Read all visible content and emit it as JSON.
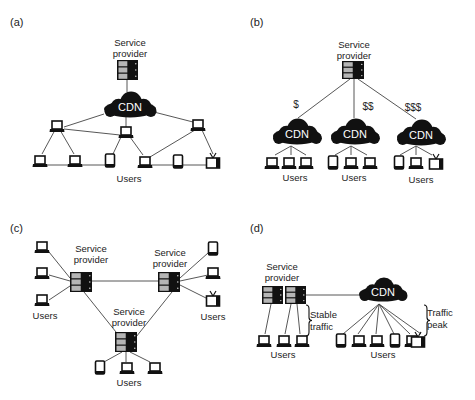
{
  "panels": [
    {
      "id": "a",
      "label": "(a)",
      "label_pos": [
        10,
        26
      ],
      "texts": [
        {
          "text": "Service",
          "x": 130,
          "y": 46,
          "size": 9.5
        },
        {
          "text": "provider",
          "x": 130,
          "y": 57,
          "size": 9.5
        },
        {
          "text": "Users",
          "x": 129,
          "y": 182,
          "size": 9.5
        }
      ],
      "servers": [
        {
          "x": 117,
          "y": 60,
          "w": 21,
          "h": 20
        }
      ],
      "clouds": [
        {
          "cx": 130,
          "cy": 106,
          "w": 52,
          "h": 26,
          "text": "CDN"
        }
      ],
      "devices": [
        {
          "type": "laptop",
          "x": 57,
          "y": 125
        },
        {
          "type": "laptop",
          "x": 126,
          "y": 131
        },
        {
          "type": "laptop",
          "x": 198,
          "y": 124
        },
        {
          "type": "laptop",
          "x": 40,
          "y": 160
        },
        {
          "type": "laptop",
          "x": 75,
          "y": 160
        },
        {
          "type": "tablet",
          "x": 110,
          "y": 160
        },
        {
          "type": "laptop",
          "x": 145,
          "y": 161
        },
        {
          "type": "tablet",
          "x": 178,
          "y": 161
        },
        {
          "type": "tv",
          "x": 213,
          "y": 161
        }
      ],
      "lines": [
        [
          127,
          80,
          127,
          92
        ],
        [
          104,
          114,
          64,
          127
        ],
        [
          126,
          117,
          126,
          127
        ],
        [
          150,
          111,
          193,
          122
        ],
        [
          64,
          129,
          120,
          135
        ],
        [
          55,
          130,
          42,
          154
        ],
        [
          60,
          130,
          74,
          154
        ],
        [
          121,
          137,
          113,
          154
        ],
        [
          130,
          137,
          143,
          155
        ],
        [
          195,
          130,
          150,
          157
        ],
        [
          202,
          130,
          213,
          154
        ],
        [
          44,
          165,
          72,
          165
        ],
        [
          80,
          165,
          108,
          165
        ],
        [
          150,
          165,
          174,
          165
        ],
        [
          182,
          165,
          208,
          165
        ]
      ]
    },
    {
      "id": "b",
      "label": "(b)",
      "label_pos": [
        250,
        26
      ],
      "texts": [
        {
          "text": "Service",
          "x": 354,
          "y": 48,
          "size": 9.5
        },
        {
          "text": "provider",
          "x": 354,
          "y": 59,
          "size": 9.5
        },
        {
          "text": "$",
          "x": 296,
          "y": 108,
          "size": 10
        },
        {
          "text": "$$",
          "x": 368,
          "y": 110,
          "size": 10
        },
        {
          "text": "$$$",
          "x": 413,
          "y": 111,
          "size": 10
        },
        {
          "text": "Users",
          "x": 295,
          "y": 181,
          "size": 9.5
        },
        {
          "text": "Users",
          "x": 354,
          "y": 181,
          "size": 9.5
        },
        {
          "text": "Users",
          "x": 421,
          "y": 183,
          "size": 9.5
        }
      ],
      "servers": [
        {
          "x": 342,
          "y": 61,
          "w": 22,
          "h": 18
        }
      ],
      "clouds": [
        {
          "cx": 297,
          "cy": 133,
          "w": 48,
          "h": 26,
          "text": "CDN"
        },
        {
          "cx": 355,
          "cy": 133,
          "w": 48,
          "h": 26,
          "text": "CDN"
        },
        {
          "cx": 421,
          "cy": 134,
          "w": 48,
          "h": 26,
          "text": "CDN"
        }
      ],
      "devices": [
        {
          "type": "laptop",
          "x": 272,
          "y": 162
        },
        {
          "type": "laptop",
          "x": 289,
          "y": 162
        },
        {
          "type": "laptop",
          "x": 306,
          "y": 162
        },
        {
          "type": "tablet",
          "x": 333,
          "y": 162
        },
        {
          "type": "laptop",
          "x": 351,
          "y": 162
        },
        {
          "type": "laptop",
          "x": 370,
          "y": 162
        },
        {
          "type": "tablet",
          "x": 399,
          "y": 162
        },
        {
          "type": "laptop",
          "x": 416,
          "y": 162
        },
        {
          "type": "tv",
          "x": 436,
          "y": 162
        }
      ],
      "lines": [
        [
          350,
          79,
          298,
          118
        ],
        [
          354,
          79,
          354,
          118
        ],
        [
          358,
          79,
          416,
          119
        ],
        [
          291,
          146,
          275,
          155
        ],
        [
          291,
          146,
          291,
          155
        ],
        [
          291,
          146,
          306,
          155
        ],
        [
          351,
          146,
          335,
          155
        ],
        [
          351,
          146,
          351,
          155
        ],
        [
          351,
          146,
          367,
          155
        ],
        [
          416,
          146,
          400,
          155
        ],
        [
          416,
          146,
          416,
          155
        ],
        [
          416,
          146,
          432,
          155
        ]
      ]
    },
    {
      "id": "c",
      "label": "(c)",
      "label_pos": [
        10,
        232
      ],
      "texts": [
        {
          "text": "Service",
          "x": 91,
          "y": 252,
          "size": 9.5
        },
        {
          "text": "provider",
          "x": 91,
          "y": 263,
          "size": 9.5
        },
        {
          "text": "Service",
          "x": 170,
          "y": 256,
          "size": 9.5
        },
        {
          "text": "provider",
          "x": 170,
          "y": 267,
          "size": 9.5
        },
        {
          "text": "Service",
          "x": 129,
          "y": 315,
          "size": 9.5
        },
        {
          "text": "provider",
          "x": 129,
          "y": 326,
          "size": 9.5
        },
        {
          "text": "Users",
          "x": 45,
          "y": 319,
          "size": 9.5
        },
        {
          "text": "Users",
          "x": 213,
          "y": 320,
          "size": 9.5
        },
        {
          "text": "Users",
          "x": 129,
          "y": 386,
          "size": 9.5
        }
      ],
      "servers": [
        {
          "x": 70,
          "y": 272,
          "w": 22,
          "h": 20
        },
        {
          "x": 158,
          "y": 272,
          "w": 22,
          "h": 20
        },
        {
          "x": 115,
          "y": 332,
          "w": 22,
          "h": 20
        }
      ],
      "clouds": [],
      "devices": [
        {
          "type": "laptop",
          "x": 42,
          "y": 246
        },
        {
          "type": "laptop",
          "x": 42,
          "y": 272
        },
        {
          "type": "laptop",
          "x": 42,
          "y": 299
        },
        {
          "type": "tablet",
          "x": 213,
          "y": 248
        },
        {
          "type": "laptop",
          "x": 213,
          "y": 272
        },
        {
          "type": "tv",
          "x": 213,
          "y": 299
        },
        {
          "type": "tablet",
          "x": 100,
          "y": 367
        },
        {
          "type": "laptop",
          "x": 127,
          "y": 367
        },
        {
          "type": "laptop",
          "x": 155,
          "y": 367
        }
      ],
      "lines": [
        [
          92,
          281,
          158,
          281
        ],
        [
          84,
          292,
          120,
          337
        ],
        [
          172,
          292,
          136,
          337
        ],
        [
          49,
          252,
          70,
          278
        ],
        [
          49,
          275,
          70,
          281
        ],
        [
          49,
          300,
          70,
          286
        ],
        [
          180,
          278,
          208,
          253
        ],
        [
          180,
          281,
          208,
          275
        ],
        [
          180,
          285,
          208,
          299
        ],
        [
          126,
          352,
          126,
          362
        ],
        [
          122,
          352,
          104,
          362
        ],
        [
          130,
          352,
          150,
          362
        ]
      ]
    },
    {
      "id": "d",
      "label": "(d)",
      "label_pos": [
        250,
        232
      ],
      "texts": [
        {
          "text": "Service",
          "x": 282,
          "y": 270,
          "size": 9.5
        },
        {
          "text": "provider",
          "x": 282,
          "y": 281,
          "size": 9.5
        },
        {
          "text": "Stable",
          "x": 310,
          "y": 318,
          "size": 9.5,
          "anchor": "start"
        },
        {
          "text": "traffic",
          "x": 310,
          "y": 330,
          "size": 9.5,
          "anchor": "start"
        },
        {
          "text": "Traffic",
          "x": 427,
          "y": 316,
          "size": 9.5,
          "anchor": "start"
        },
        {
          "text": "peak",
          "x": 427,
          "y": 328,
          "size": 9.5,
          "anchor": "start"
        },
        {
          "text": "Users",
          "x": 283,
          "y": 358,
          "size": 9.5
        },
        {
          "text": "Users",
          "x": 383,
          "y": 358,
          "size": 9.5
        }
      ],
      "servers": [
        {
          "x": 262,
          "y": 286,
          "w": 21,
          "h": 18
        },
        {
          "x": 285,
          "y": 286,
          "w": 21,
          "h": 18
        }
      ],
      "clouds": [
        {
          "cx": 383,
          "cy": 291,
          "w": 48,
          "h": 24,
          "text": "CDN"
        }
      ],
      "devices": [
        {
          "type": "laptop",
          "x": 264,
          "y": 340
        },
        {
          "type": "laptop",
          "x": 284,
          "y": 340
        },
        {
          "type": "laptop",
          "x": 302,
          "y": 340
        },
        {
          "type": "tablet",
          "x": 341,
          "y": 340
        },
        {
          "type": "laptop",
          "x": 359,
          "y": 340
        },
        {
          "type": "laptop",
          "x": 377,
          "y": 340
        },
        {
          "type": "tablet",
          "x": 395,
          "y": 340
        },
        {
          "type": "laptop",
          "x": 412,
          "y": 340
        },
        {
          "type": "tv",
          "x": 418,
          "y": 340
        }
      ],
      "lines": [
        [
          306,
          295,
          360,
          295
        ],
        [
          271,
          304,
          265,
          334
        ],
        [
          291,
          304,
          285,
          334
        ],
        [
          297,
          304,
          300,
          334
        ],
        [
          379,
          304,
          343,
          334
        ],
        [
          379,
          304,
          358,
          334
        ],
        [
          379,
          304,
          376,
          334
        ],
        [
          379,
          304,
          394,
          334
        ],
        [
          379,
          304,
          410,
          334
        ],
        [
          379,
          304,
          421,
          334
        ]
      ],
      "braces": [
        {
          "x": 306,
          "y1": 305,
          "y2": 336
        },
        {
          "x": 424,
          "y1": 305,
          "y2": 336
        }
      ]
    }
  ],
  "colors": {
    "ink": "#111111",
    "line": "#444444",
    "server_light": "#b5b5b5",
    "text": "#222222"
  }
}
